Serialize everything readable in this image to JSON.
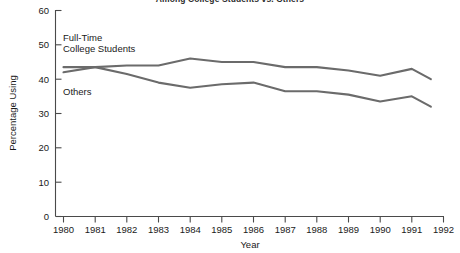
{
  "chart_data": {
    "type": "line",
    "title": "Among College Students vs. Others",
    "xlabel": "Year",
    "ylabel": "Percentage Using",
    "xlim": [
      1980,
      1992
    ],
    "ylim": [
      0,
      60
    ],
    "grid": false,
    "legend_position": "inline-left",
    "x_ticks": [
      "1980",
      "1981",
      "1982",
      "1983",
      "1984",
      "1985",
      "1986",
      "1987",
      "1988",
      "1989",
      "1990",
      "1991",
      "1992"
    ],
    "y_ticks": [
      "0",
      "10",
      "20",
      "30",
      "40",
      "50",
      "60"
    ],
    "x": [
      1980,
      1981,
      1982,
      1983,
      1984,
      1985,
      1986,
      1987,
      1988,
      1989,
      1990,
      1991,
      1991.6
    ],
    "series": [
      {
        "name": "Full-Time College Students",
        "label_line_1": "Full-Time",
        "label_line_2": "College Students",
        "color": "#6b6b6b",
        "values": [
          42.0,
          43.5,
          44.0,
          44.0,
          46.0,
          45.0,
          45.0,
          43.5,
          43.5,
          42.5,
          41.0,
          43.0,
          40.0
        ]
      },
      {
        "name": "Others",
        "label_line_1": "Others",
        "color": "#6b6b6b",
        "values": [
          43.5,
          43.5,
          41.5,
          39.0,
          37.5,
          38.5,
          39.0,
          36.5,
          36.5,
          35.5,
          33.5,
          35.0,
          32.0
        ]
      }
    ]
  },
  "colors": {
    "line": "#6b6b6b",
    "axis": "#4a4a4a",
    "text": "#1a1a1a",
    "background": "#ffffff"
  }
}
